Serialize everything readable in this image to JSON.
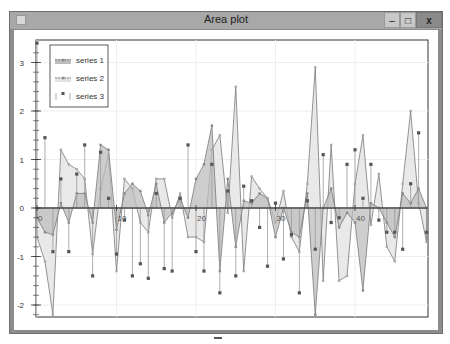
{
  "window": {
    "title": "Area plot",
    "controls": {
      "minimize": "–",
      "maximize": "□",
      "close": "x"
    }
  },
  "legend": [
    {
      "label": "series 1",
      "style": "area-dark"
    },
    {
      "label": "series 2",
      "style": "area-light"
    },
    {
      "label": "series 3",
      "style": "stem"
    }
  ],
  "colors": {
    "series1_fill": "#bdbdbd",
    "series2_fill": "#e2e2e2",
    "line": "#7a7a7a",
    "stem": "#999999",
    "marker": "#555555",
    "axis": "#333333",
    "grid": "#eeeeee"
  },
  "chart_data": {
    "type": "area",
    "title": "Area plot",
    "xlabel": "",
    "ylabel": "",
    "xlim": [
      0,
      49
    ],
    "ylim": [
      -2.25,
      3.4
    ],
    "xticks": [
      0,
      10,
      20,
      30,
      40
    ],
    "yticks": [
      -2,
      -1,
      0,
      1,
      2,
      3
    ],
    "grid": true,
    "legend_position": "upper left",
    "x": [
      0,
      1,
      2,
      3,
      4,
      5,
      6,
      7,
      8,
      9,
      10,
      11,
      12,
      13,
      14,
      15,
      16,
      17,
      18,
      19,
      20,
      21,
      22,
      23,
      24,
      25,
      26,
      27,
      28,
      29,
      30,
      31,
      32,
      33,
      34,
      35,
      36,
      37,
      38,
      39,
      40,
      41,
      42,
      43,
      44,
      45,
      46,
      47,
      48,
      49
    ],
    "series": [
      {
        "name": "series 1",
        "values": [
          -0.2,
          -0.5,
          -0.55,
          0.1,
          -0.3,
          0.3,
          0.3,
          -0.3,
          1.3,
          1.2,
          -0.45,
          0.3,
          0.5,
          0.35,
          -0.15,
          0.5,
          -0.3,
          -0.1,
          0.2,
          -0.2,
          0.6,
          0.9,
          1.7,
          -1.3,
          0.6,
          -0.8,
          0.15,
          0.1,
          0.3,
          0.2,
          -0.6,
          0.0,
          -0.5,
          -0.6,
          0.3,
          -2.2,
          0.0,
          0.4,
          -0.4,
          -0.1,
          -0.3,
          -1.7,
          0.1,
          0.0,
          -0.3,
          -0.6,
          0.3,
          0.1,
          0.4,
          0.0
        ]
      },
      {
        "name": "series 2",
        "values": [
          -0.6,
          -1.1,
          -2.2,
          1.2,
          0.9,
          0.8,
          0.6,
          -0.95,
          0.4,
          1.1,
          -1.3,
          0.6,
          0.4,
          -0.3,
          -0.5,
          0.6,
          0.6,
          -0.2,
          0.3,
          -0.6,
          -0.6,
          -0.7,
          1.2,
          1.5,
          -0.1,
          2.5,
          -1.3,
          0.65,
          0.4,
          0.2,
          -0.3,
          0.35,
          -0.6,
          -0.9,
          0.5,
          2.9,
          -1.5,
          1.3,
          -1.5,
          -1.4,
          0.5,
          1.5,
          -0.35,
          0.7,
          -0.8,
          -1.1,
          0.5,
          2.0,
          0.1,
          -0.7
        ]
      },
      {
        "name": "series 3",
        "type": "stem",
        "values": [
          3.4,
          1.45,
          -0.9,
          0.6,
          -0.9,
          0.7,
          1.3,
          -1.4,
          1.15,
          0.2,
          -0.95,
          -0.25,
          -1.4,
          -1.15,
          -1.45,
          0.3,
          -1.25,
          -1.3,
          0.2,
          1.3,
          -0.9,
          -1.3,
          0.9,
          -1.75,
          0.35,
          -1.4,
          0.45,
          0.15,
          -0.4,
          -1.2,
          0.1,
          -1.05,
          -0.55,
          -1.75,
          0.15,
          -0.85,
          1.1,
          -0.3,
          -0.2,
          0.9,
          1.2,
          0.2,
          0.9,
          -0.25,
          -0.5,
          -0.5,
          -0.85,
          0.5,
          1.55,
          -0.5
        ]
      }
    ]
  }
}
